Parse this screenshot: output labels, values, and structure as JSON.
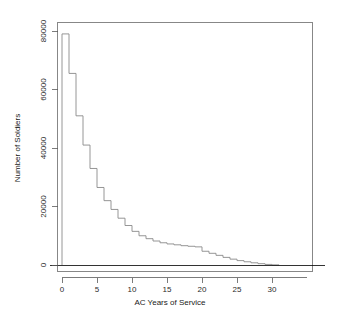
{
  "chart_data": {
    "type": "bar",
    "title": "",
    "subtitle": "",
    "xlabel": "AC Years of Service",
    "ylabel": "Number of Soldiers",
    "xlim": [
      0,
      31
    ],
    "ylim": [
      0,
      83000
    ],
    "grid": false,
    "legend": null,
    "annotations": [],
    "style": "R base graphics step histogram",
    "xticks": [
      0,
      5,
      10,
      15,
      20,
      25,
      30
    ],
    "xticklabels": [
      "0",
      "5",
      "10",
      "15",
      "20",
      "25",
      "30"
    ],
    "yticks": [
      0,
      20000,
      40000,
      60000,
      80000
    ],
    "yticklabels": [
      "0",
      "20000",
      "40000",
      "60000",
      "80000"
    ],
    "categories": [
      "0",
      "1",
      "2",
      "3",
      "4",
      "5",
      "6",
      "7",
      "8",
      "9",
      "10",
      "11",
      "12",
      "13",
      "14",
      "15",
      "16",
      "17",
      "18",
      "19",
      "20",
      "21",
      "22",
      "23",
      "24",
      "25",
      "26",
      "27",
      "28",
      "29",
      "30"
    ],
    "bin_edges": [
      0,
      1,
      2,
      3,
      4,
      5,
      6,
      7,
      8,
      9,
      10,
      11,
      12,
      13,
      14,
      15,
      16,
      17,
      18,
      19,
      20,
      21,
      22,
      23,
      24,
      25,
      26,
      27,
      28,
      29,
      30,
      31
    ],
    "values": [
      79000,
      65500,
      51000,
      41000,
      33000,
      26500,
      22000,
      19000,
      16000,
      13500,
      11500,
      10000,
      9000,
      8200,
      7600,
      7200,
      6900,
      6600,
      6400,
      6200,
      4700,
      4000,
      3300,
      2600,
      2000,
      1500,
      1100,
      750,
      450,
      200,
      50
    ],
    "series": [
      {
        "name": "Number of Soldiers",
        "values": [
          79000,
          65500,
          51000,
          41000,
          33000,
          26500,
          22000,
          19000,
          16000,
          13500,
          11500,
          10000,
          9000,
          8200,
          7600,
          7200,
          6900,
          6600,
          6400,
          6200,
          4700,
          4000,
          3300,
          2600,
          2000,
          1500,
          1100,
          750,
          450,
          200,
          50
        ],
        "color": "#8a8a8a"
      }
    ]
  },
  "colors": {
    "background": "#ffffff",
    "line": "#8a8a8a",
    "frame": "#7a7a7a",
    "axis": "#000000",
    "text": "#1a1a1a"
  }
}
